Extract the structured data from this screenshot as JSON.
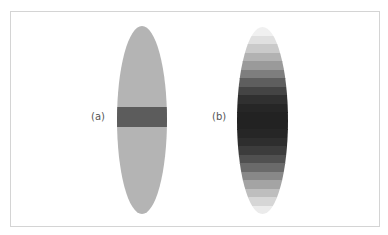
{
  "figure": {
    "frame_border_color": "#d4d4d4",
    "panels": [
      {
        "label": "(a)",
        "description": "uniform ellipse with single dark horizontal band",
        "base_color": "#b4b4b4",
        "band_color": "#5c5c5c",
        "band_top_px": 81,
        "band_height_px": 20
      },
      {
        "label": "(b)",
        "description": "ellipse with stepped vertical gradient, darkest at center",
        "stripes": [
          "#f0f0f0",
          "#e0e0e0",
          "#cacaca",
          "#b2b2b2",
          "#9a9a9a",
          "#7e7e7e",
          "#5e5e5e",
          "#444444",
          "#303030",
          "#262626",
          "#222222",
          "#222222",
          "#262626",
          "#2e2e2e",
          "#3c3c3c",
          "#505050",
          "#6a6a6a",
          "#888888",
          "#a4a4a4",
          "#bebebe",
          "#d6d6d6",
          "#ebebeb"
        ]
      }
    ]
  }
}
